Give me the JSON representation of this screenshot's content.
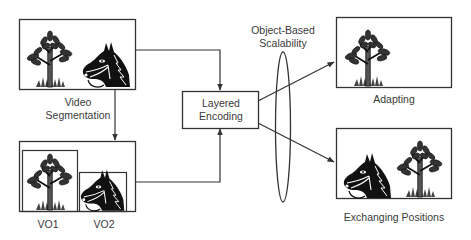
{
  "diagram": {
    "colors": {
      "stroke": "#333333",
      "text": "#3a3a3a",
      "icon_fill": "#111111",
      "icon_mid": "#555555",
      "background": "#ffffff"
    },
    "nodes": {
      "source_frame": {
        "label_line1": "Video",
        "label_line2": "Segmentation",
        "contents": [
          "tree-icon",
          "horse-icon"
        ]
      },
      "segmented_objects": {
        "objects": [
          {
            "label": "VO1",
            "icon": "tree-icon"
          },
          {
            "label": "VO2",
            "icon": "horse-icon"
          }
        ]
      },
      "encoder": {
        "label_line1": "Layered",
        "label_line2": "Encoding"
      },
      "scalability": {
        "label_line1": "Object-Based",
        "label_line2": "Scalability",
        "shape": "ellipse"
      },
      "output_adapting": {
        "label": "Adapting",
        "contents": [
          "tree-icon"
        ]
      },
      "output_exchanging": {
        "label": "Exchanging Positions",
        "contents": [
          "horse-icon",
          "tree-icon"
        ]
      }
    },
    "edges": [
      {
        "from": "source_frame",
        "to": "segmented_objects"
      },
      {
        "from": "source_frame",
        "to": "encoder"
      },
      {
        "from": "segmented_objects",
        "to": "encoder"
      },
      {
        "from": "encoder",
        "to": "output_adapting"
      },
      {
        "from": "encoder",
        "to": "output_exchanging"
      }
    ]
  }
}
